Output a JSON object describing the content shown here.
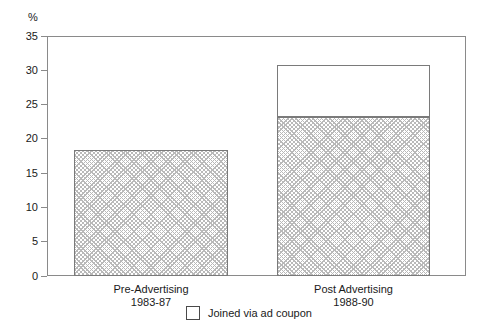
{
  "chart_data": {
    "type": "bar",
    "title": "",
    "subtitle": "",
    "xlabel": "",
    "ylabel": "%",
    "ylim": [
      0,
      35
    ],
    "ytick_step": 5,
    "yticks": [
      "35",
      "30",
      "25",
      "20",
      "15",
      "10",
      "5",
      "0"
    ],
    "grid": false,
    "stacked": true,
    "legend_position": "bottom-center",
    "categories": [
      "Pre-Advertising\n1983-87",
      "Post Advertising\n1988-90"
    ],
    "category_lines": [
      {
        "line1": "Pre-Advertising",
        "line2": "1983-87"
      },
      {
        "line1": "Post Advertising",
        "line2": "1988-90"
      }
    ],
    "series": [
      {
        "name": "Joined by other means",
        "fill": "cross-hatch",
        "values": [
          18.4,
          23.2
        ]
      },
      {
        "name": "Joined via ad coupon",
        "fill": "white",
        "values": [
          0,
          7.5
        ]
      }
    ],
    "totals": [
      18.4,
      30.7
    ],
    "legend": [
      {
        "label": "Joined via ad coupon",
        "swatch": "white-box"
      }
    ],
    "colors": {
      "hatch_line": "#b9b9b9",
      "bar_border": "#7a7a7a",
      "axis": "#8a8a8a",
      "text": "#1a1a1a",
      "background": "#ffffff"
    }
  }
}
